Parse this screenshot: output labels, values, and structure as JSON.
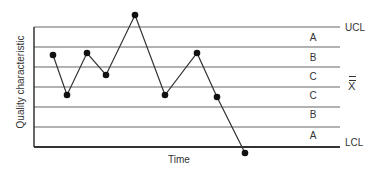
{
  "chart_data": {
    "type": "line",
    "title": "",
    "xlabel": "Time",
    "ylabel": "Quality characteristic",
    "x": [
      1,
      2,
      3,
      4,
      5,
      6,
      7,
      8,
      9
    ],
    "series": [
      {
        "name": "Quality characteristic",
        "values": [
          1.6,
          -0.4,
          1.7,
          0.6,
          3.6,
          -0.4,
          1.7,
          -0.5,
          -3.3
        ]
      }
    ],
    "control_lines": {
      "UCL": 3,
      "center": 0,
      "LCL": -3,
      "sigma_lines": [
        3,
        2,
        1,
        0,
        -1,
        -2,
        -3
      ]
    },
    "zones_upper": [
      "A",
      "B",
      "C"
    ],
    "zones_lower": [
      "C",
      "B",
      "A"
    ],
    "line_labels": {
      "ucl": "UCL",
      "center": "X",
      "lcl": "LCL"
    },
    "grid": true,
    "legend": "none",
    "colors": {
      "line": "#333333",
      "grid": "#555555",
      "points": "#111111"
    }
  }
}
